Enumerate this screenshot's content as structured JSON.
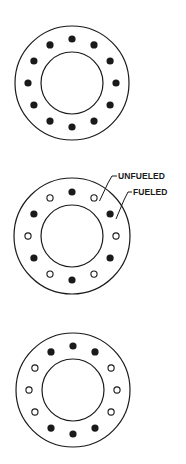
{
  "colors": {
    "ink": "#1a1a1a",
    "background": "#ffffff"
  },
  "legend": {
    "unfueled_label": "UNFUELED",
    "fueled_label": "FUELED"
  },
  "diagrams": [
    {
      "name": "all-fueled-ring",
      "cx": 72,
      "cy": 83,
      "outer_r": 57,
      "inner_r": 31,
      "slot_r": 44,
      "slots": [
        "F",
        "F",
        "F",
        "F",
        "F",
        "F",
        "F",
        "F",
        "F",
        "F",
        "F",
        "F"
      ]
    },
    {
      "name": "alternating-fueled-ring",
      "cx": 72,
      "cy": 236,
      "outer_r": 58,
      "inner_r": 31,
      "slot_r": 44,
      "slots": [
        "F",
        "U",
        "F",
        "U",
        "F",
        "U",
        "F",
        "U",
        "F",
        "U",
        "F",
        "U"
      ]
    },
    {
      "name": "paired-fueled-ring",
      "cx": 73,
      "cy": 390,
      "outer_r": 57,
      "inner_r": 31,
      "slot_r": 44,
      "slots": [
        "F",
        "F",
        "U",
        "U",
        "U",
        "F",
        "F",
        "F",
        "U",
        "U",
        "U",
        "F"
      ]
    }
  ]
}
